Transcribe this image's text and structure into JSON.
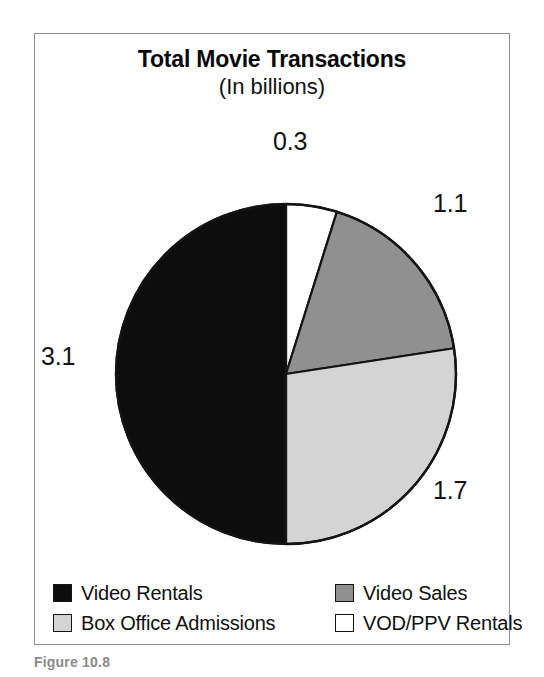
{
  "figure": {
    "caption": "Figure 10.8"
  },
  "chart_data": {
    "type": "pie",
    "title": "Total Movie Transactions",
    "subtitle": "(In billions)",
    "unit": "billions",
    "total": 6.2,
    "legend_position": "bottom",
    "start_angle_deg": 0,
    "direction": "clockwise",
    "categories": [
      "VOD/PPV Rentals",
      "Video Sales",
      "Box Office Admissions",
      "Video Rentals"
    ],
    "values": [
      0.3,
      1.1,
      1.7,
      3.1
    ],
    "colors": [
      "#ffffff",
      "#909090",
      "#d4d4d4",
      "#0d0d0d"
    ],
    "slices": [
      {
        "label": "VOD/PPV Rentals",
        "value": "0.3",
        "number": 0.3,
        "color": "#ffffff",
        "percent": 4.8,
        "start_deg": 0,
        "sweep_deg": 17.4
      },
      {
        "label": "Video Sales",
        "value": "1.1",
        "number": 1.1,
        "color": "#909090",
        "percent": 17.7,
        "start_deg": 17.4,
        "sweep_deg": 63.9
      },
      {
        "label": "Box Office Admissions",
        "value": "1.7",
        "number": 1.7,
        "color": "#d4d4d4",
        "percent": 27.4,
        "start_deg": 81.3,
        "sweep_deg": 98.7
      },
      {
        "label": "Video Rentals",
        "value": "3.1",
        "number": 3.1,
        "color": "#0d0d0d",
        "percent": 50.0,
        "start_deg": 180.0,
        "sweep_deg": 180.0
      }
    ],
    "legend": [
      {
        "label": "Video Rentals",
        "color": "#0d0d0d"
      },
      {
        "label": "Video Sales",
        "color": "#909090"
      },
      {
        "label": "Box Office Admissions",
        "color": "#d4d4d4"
      },
      {
        "label": "VOD/PPV Rentals",
        "color": "#ffffff"
      }
    ]
  }
}
